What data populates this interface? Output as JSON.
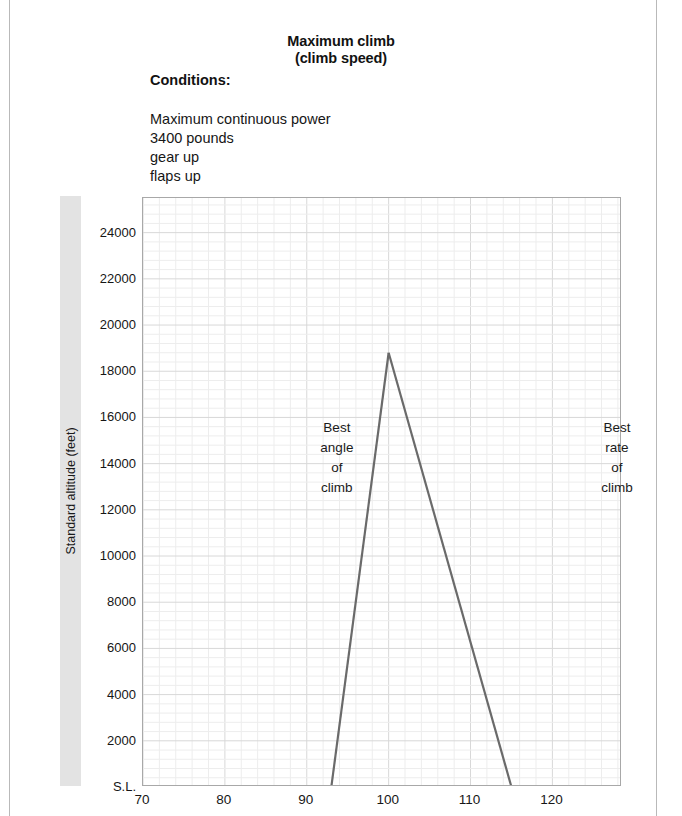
{
  "document": {
    "title": "Maximum climb",
    "subtitle": "(climb speed)",
    "conditions_heading": "Conditions:",
    "conditions": [
      "Maximum continuous power",
      "3400 pounds",
      "gear up",
      "flaps up"
    ]
  },
  "axis": {
    "y_title": "Standard altitude (feet)",
    "y_ticks": [
      "24000",
      "22000",
      "20000",
      "18000",
      "16000",
      "14000",
      "12000",
      "10000",
      "8000",
      "6000",
      "4000",
      "2000",
      "S.L."
    ],
    "x_ticks": [
      "70",
      "80",
      "90",
      "100",
      "110",
      "120"
    ]
  },
  "annotations": {
    "left": "Best\nangle\nof\nclimb",
    "right": "Best\nrate\nof\nclimb"
  },
  "colors": {
    "curve": "#6a6a6a",
    "grid_major": "#d8d8d8",
    "grid_minor": "#ededed",
    "axis_frame": "#a8a8a8",
    "band": "#e3e3e3",
    "text": "#161616"
  },
  "chart_data": {
    "type": "line",
    "title": "Maximum climb (climb speed)",
    "xlabel": "",
    "ylabel": "Standard altitude (feet)",
    "xlim": [
      70,
      128.5
    ],
    "ylim": [
      0,
      25500
    ],
    "y_tick_values": [
      24000,
      22000,
      20000,
      18000,
      16000,
      14000,
      12000,
      10000,
      8000,
      6000,
      4000,
      2000,
      0
    ],
    "y_tick_labels": [
      "24000",
      "22000",
      "20000",
      "18000",
      "16000",
      "14000",
      "12000",
      "10000",
      "8000",
      "6000",
      "4000",
      "2000",
      "S.L."
    ],
    "x_tick_values": [
      70,
      80,
      90,
      100,
      110,
      120
    ],
    "grid": true,
    "grid_minor_divisions": 5,
    "legend": "none",
    "series": [
      {
        "name": "Best angle of climb",
        "x": [
          93.0,
          100.0
        ],
        "y": [
          0,
          18800
        ]
      },
      {
        "name": "Best rate of climb",
        "x": [
          100.0,
          115.0
        ],
        "y": [
          18800,
          0
        ]
      }
    ],
    "annotations": [
      {
        "text": "Best angle of climb",
        "x": 93.8,
        "y": 14200
      },
      {
        "text": "Best rate of climb",
        "x": 128.0,
        "y": 14200
      }
    ]
  }
}
